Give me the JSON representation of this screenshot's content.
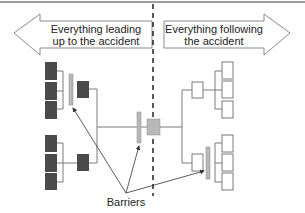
{
  "left_arrow": {
    "line1": "Everything leading",
    "line2": "up to the accident"
  },
  "right_arrow": {
    "line1": "Everything following",
    "line2": "the accident"
  },
  "barriers_label": "Barriers",
  "colors": {
    "dark_box": "#4a4a4a",
    "barrier": "#b8b8b8",
    "center_event": "#b8b8b8",
    "line": "#7a7a7a",
    "white_box_border": "#7a7a7a",
    "arrow_border": "#8a8a8a",
    "dashed_line": "#222222"
  },
  "left_tree": {
    "top_group_boxes": 3,
    "bottom_group_boxes": 3,
    "intermediate_boxes": 2,
    "barriers": 1
  },
  "right_tree": {
    "top_group_boxes": 3,
    "bottom_group_boxes": 3,
    "intermediate_boxes": 2,
    "barriers": 1
  },
  "center": {
    "event_box": "accident",
    "barriers": 1
  }
}
